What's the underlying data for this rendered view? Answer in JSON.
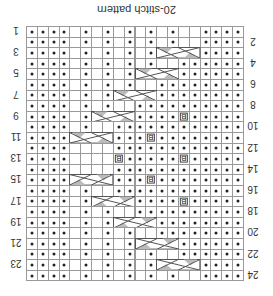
{
  "title": "20-stitch pattern",
  "grid": {
    "cols": 20,
    "rows": 24,
    "cell_w": 10.85,
    "cell_h": 10.6
  },
  "colors": {
    "line": "#999999",
    "dot": "#222222",
    "cable_shade": "#bbbbbb",
    "cable_line": "#555555"
  },
  "legend_symbols": {
    "dot": "purl",
    "blank": "knit",
    "B": "bobble",
    "cable": "4-stitch cable cross"
  },
  "row_labels": {
    "left": [
      {
        "row": 0,
        "text": "1"
      },
      {
        "row": 2,
        "text": "3"
      },
      {
        "row": 4,
        "text": "5"
      },
      {
        "row": 6,
        "text": "7"
      },
      {
        "row": 8,
        "text": "9"
      },
      {
        "row": 10,
        "text": "11"
      },
      {
        "row": 12,
        "text": "13"
      },
      {
        "row": 14,
        "text": "15"
      },
      {
        "row": 16,
        "text": "17"
      },
      {
        "row": 18,
        "text": "19"
      },
      {
        "row": 20,
        "text": "21"
      },
      {
        "row": 22,
        "text": "23"
      }
    ],
    "right": [
      {
        "row": 1,
        "text": "2"
      },
      {
        "row": 3,
        "text": "4"
      },
      {
        "row": 5,
        "text": "6"
      },
      {
        "row": 7,
        "text": "8"
      },
      {
        "row": 9,
        "text": "10"
      },
      {
        "row": 11,
        "text": "12"
      },
      {
        "row": 13,
        "text": "14"
      },
      {
        "row": 15,
        "text": "16"
      },
      {
        "row": 17,
        "text": "18"
      },
      {
        "row": 19,
        "text": "20"
      },
      {
        "row": 21,
        "text": "22"
      },
      {
        "row": 23,
        "text": "24"
      }
    ]
  },
  "rows": [
    {
      "dots": [
        0,
        1,
        2,
        3,
        5,
        7,
        9,
        11,
        13,
        16,
        17,
        18,
        19
      ]
    },
    {
      "dots": [
        0,
        1,
        2,
        3,
        5,
        7,
        9,
        11,
        13,
        16,
        17,
        18,
        19
      ]
    },
    {
      "dots": [
        0,
        1,
        2,
        3,
        5,
        7,
        9,
        11,
        16,
        17,
        18,
        19
      ],
      "cable": {
        "start": 12,
        "flip": false
      }
    },
    {
      "dots": [
        0,
        1,
        2,
        3,
        5,
        7,
        9,
        11,
        14,
        15,
        16,
        17,
        18,
        19
      ]
    },
    {
      "dots": [
        0,
        1,
        2,
        3,
        5,
        7,
        9,
        14,
        15,
        16,
        17,
        18,
        19
      ],
      "cable": {
        "start": 10,
        "flip": false
      }
    },
    {
      "dots": [
        0,
        1,
        2,
        3,
        5,
        7,
        9,
        12,
        13,
        14,
        15,
        16,
        17,
        18,
        19
      ]
    },
    {
      "dots": [
        0,
        1,
        2,
        3,
        5,
        7,
        12,
        13,
        14,
        15,
        16,
        17,
        18,
        19
      ],
      "cable": {
        "start": 8,
        "flip": false
      }
    },
    {
      "dots": [
        0,
        1,
        2,
        3,
        5,
        7,
        10,
        11,
        12,
        13,
        14,
        15,
        16,
        17,
        18,
        19
      ]
    },
    {
      "dots": [
        0,
        1,
        2,
        3,
        5,
        10,
        11,
        12,
        13,
        15,
        16,
        17,
        18,
        19
      ],
      "bobbles": [
        14
      ],
      "cable": {
        "start": 6,
        "flip": false
      }
    },
    {
      "dots": [
        0,
        1,
        2,
        3,
        5,
        8,
        9,
        10,
        11,
        12,
        13,
        14,
        15,
        16,
        17,
        18,
        19
      ]
    },
    {
      "dots": [
        0,
        1,
        2,
        3,
        8,
        9,
        10,
        12,
        13,
        14,
        15,
        16,
        17,
        18,
        19
      ],
      "bobbles": [
        11
      ],
      "cable": {
        "start": 4,
        "flip": false
      }
    },
    {
      "dots": [
        0,
        1,
        2,
        3,
        8,
        9,
        10,
        11,
        12,
        13,
        14,
        15,
        16,
        17,
        18,
        19
      ]
    },
    {
      "dots": [
        0,
        1,
        2,
        3,
        9,
        10,
        11,
        12,
        13,
        15,
        16,
        17,
        18,
        19
      ],
      "bobbles": [
        8,
        14
      ]
    },
    {
      "dots": [
        0,
        1,
        2,
        3,
        8,
        9,
        10,
        11,
        12,
        13,
        14,
        15,
        16,
        17,
        18,
        19
      ]
    },
    {
      "dots": [
        0,
        1,
        2,
        3,
        8,
        9,
        10,
        12,
        13,
        14,
        15,
        16,
        17,
        18,
        19
      ],
      "bobbles": [
        11
      ],
      "cable": {
        "start": 4,
        "flip": true
      }
    },
    {
      "dots": [
        0,
        1,
        2,
        3,
        5,
        8,
        9,
        10,
        11,
        12,
        13,
        14,
        15,
        16,
        17,
        18,
        19
      ]
    },
    {
      "dots": [
        0,
        1,
        2,
        3,
        5,
        10,
        11,
        12,
        13,
        15,
        16,
        17,
        18,
        19
      ],
      "bobbles": [
        14
      ],
      "cable": {
        "start": 6,
        "flip": true
      }
    },
    {
      "dots": [
        0,
        1,
        2,
        3,
        5,
        7,
        10,
        11,
        12,
        13,
        14,
        15,
        16,
        17,
        18,
        19
      ]
    },
    {
      "dots": [
        0,
        1,
        2,
        3,
        5,
        7,
        12,
        13,
        14,
        15,
        16,
        17,
        18,
        19
      ],
      "cable": {
        "start": 8,
        "flip": true
      }
    },
    {
      "dots": [
        0,
        1,
        2,
        3,
        5,
        7,
        9,
        12,
        13,
        14,
        15,
        16,
        17,
        18,
        19
      ]
    },
    {
      "dots": [
        0,
        1,
        2,
        3,
        5,
        7,
        9,
        14,
        15,
        16,
        17,
        18,
        19
      ],
      "cable": {
        "start": 10,
        "flip": true
      }
    },
    {
      "dots": [
        0,
        1,
        2,
        3,
        5,
        7,
        9,
        11,
        14,
        15,
        16,
        17,
        18,
        19
      ]
    },
    {
      "dots": [
        0,
        1,
        2,
        3,
        5,
        7,
        9,
        11,
        16,
        17,
        18,
        19
      ],
      "cable": {
        "start": 12,
        "flip": true
      }
    },
    {
      "dots": [
        0,
        1,
        2,
        3,
        5,
        7,
        9,
        11,
        13,
        16,
        17,
        18,
        19
      ]
    }
  ],
  "bobble_label": "B"
}
